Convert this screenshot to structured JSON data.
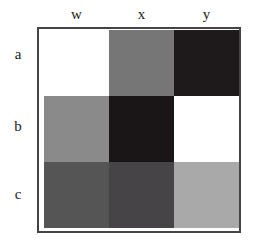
{
  "chart_data": {
    "type": "heatmap",
    "title": "",
    "xlabel": "",
    "ylabel": "",
    "columns": [
      "w",
      "x",
      "y"
    ],
    "rows": [
      "a",
      "b",
      "c"
    ],
    "values": [
      [
        0.0,
        0.55,
        0.9
      ],
      [
        0.45,
        0.92,
        0.0
      ],
      [
        0.7,
        0.75,
        0.35
      ]
    ],
    "colors": [
      [
        "#ffffff",
        "#767676",
        "#1e1a1c"
      ],
      [
        "#8a8a8a",
        "#1a1618",
        "#ffffff"
      ],
      [
        "#555555",
        "#464446",
        "#a9a9a9"
      ]
    ],
    "colormap": "grayscale (white = low, black = high)",
    "legend": "none"
  }
}
